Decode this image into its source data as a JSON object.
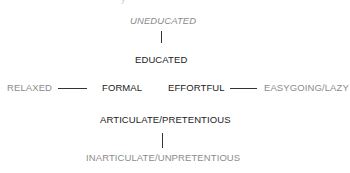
{
  "diagram": {
    "type": "axes-of-perception",
    "colors": {
      "primary_text": "#222222",
      "secondary_text": "#8c8c8c",
      "connector": "#333333"
    },
    "top_remnant": "y",
    "vertical_axis_top": {
      "negative": "UNEDUCATED",
      "positive": "EDUCATED"
    },
    "horizontal_axis": {
      "left_negative": "RELAXED",
      "left_positive": "FORMAL",
      "right_positive": "EFFORTFUL",
      "right_negative": "EASYGOING/LAZY"
    },
    "vertical_axis_bottom": {
      "positive": "ARTICULATE/PRETENTIOUS",
      "negative": "INARTICULATE/UNPRETENTIOUS"
    }
  }
}
